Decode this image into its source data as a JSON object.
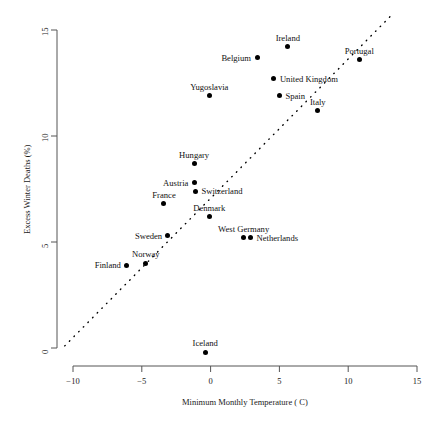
{
  "chart_data": {
    "type": "scatter",
    "title": "",
    "xlabel": "Minimum Monthly Temperature ( C)",
    "ylabel": "Excess Winter Deaths (%)",
    "xlim": [
      -10,
      15
    ],
    "ylim": [
      0,
      15
    ],
    "xticks": [
      "-10",
      "-5",
      "0",
      "5",
      "10",
      "15"
    ],
    "xtick_values": [
      -10,
      -5,
      0,
      5,
      10,
      15
    ],
    "yticks": [
      "0",
      "5",
      "10",
      "15"
    ],
    "ytick_values": [
      0,
      5,
      10,
      15
    ],
    "grid": false,
    "legend": "none",
    "points": [
      {
        "label": "Ireland",
        "x": 5.6,
        "y": 14.2,
        "label_pos": "above"
      },
      {
        "label": "Belgium",
        "x": 3.4,
        "y": 13.7,
        "label_pos": "left"
      },
      {
        "label": "Portugal",
        "x": 10.8,
        "y": 13.6,
        "label_pos": "above"
      },
      {
        "label": "United Kingdom",
        "x": 4.6,
        "y": 12.7,
        "label_pos": "right"
      },
      {
        "label": "Yugoslavia",
        "x": -0.1,
        "y": 11.9,
        "label_pos": "above"
      },
      {
        "label": "Spain",
        "x": 5.0,
        "y": 11.9,
        "label_pos": "right"
      },
      {
        "label": "Italy",
        "x": 7.8,
        "y": 11.2,
        "label_pos": "above"
      },
      {
        "label": "Hungary",
        "x": -1.2,
        "y": 8.7,
        "label_pos": "above"
      },
      {
        "label": "Austria",
        "x": -1.2,
        "y": 7.8,
        "label_pos": "left"
      },
      {
        "label": "Switzerland",
        "x": -1.1,
        "y": 7.4,
        "label_pos": "right"
      },
      {
        "label": "France",
        "x": -3.4,
        "y": 6.8,
        "label_pos": "above"
      },
      {
        "label": "Denmark",
        "x": -0.1,
        "y": 6.2,
        "label_pos": "above"
      },
      {
        "label": "West Germany",
        "x": 2.4,
        "y": 5.2,
        "label_pos": "above"
      },
      {
        "label": "Netherlands",
        "x": 2.9,
        "y": 5.2,
        "label_pos": "right"
      },
      {
        "label": "Sweden",
        "x": -3.1,
        "y": 5.3,
        "label_pos": "left"
      },
      {
        "label": "Norway",
        "x": -4.7,
        "y": 4.0,
        "label_pos": "above"
      },
      {
        "label": "Finland",
        "x": -6.1,
        "y": 3.9,
        "label_pos": "left"
      },
      {
        "label": "Iceland",
        "x": -0.4,
        "y": -0.2,
        "label_pos": "above"
      }
    ],
    "trend_line": {
      "style": "dotted",
      "x_start": -10.6,
      "y_start": 0.1,
      "x_end": 13.3,
      "y_end": 15.8
    },
    "marker_color": "#000000",
    "axis_color": "#555555"
  }
}
